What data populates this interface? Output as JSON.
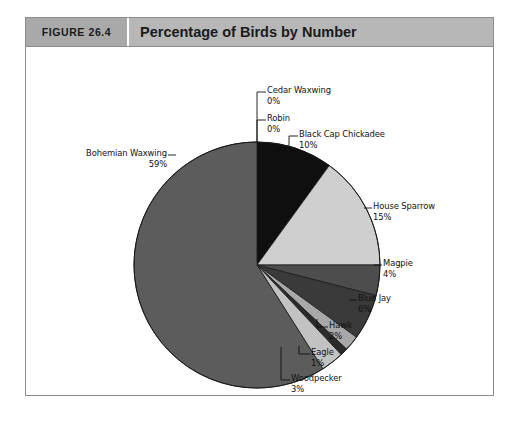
{
  "figure": {
    "number_label": "FIGURE 26.4",
    "title": "Percentage of Birds by Number",
    "header_number_bg": "#a9a9a9",
    "header_title_bg": "#b7b7b7",
    "frame_border": "#8d8d8d",
    "background": "#ffffff"
  },
  "chart_data": {
    "type": "pie",
    "title": "Percentage of Birds by Number",
    "xlabel": "",
    "ylabel": "",
    "units": "percent",
    "start_angle_deg": 0,
    "direction": "clockwise",
    "legend": "none (direct labels with leader lines)",
    "grid": false,
    "categories": [
      "Cedar Waxwing",
      "Robin",
      "Black Cap Chickadee",
      "House Sparrow",
      "Magpie",
      "Blue Jay",
      "Hawk",
      "Eagle",
      "Woodpecker",
      "Bohemian Waxwing"
    ],
    "values": [
      0,
      0,
      10,
      15,
      4,
      6,
      2,
      1,
      3,
      59
    ],
    "slices": [
      {
        "label": "Cedar Waxwing",
        "value": 0,
        "value_text": "0%",
        "color": "#d9d9d9"
      },
      {
        "label": "Robin",
        "value": 0,
        "value_text": "0%",
        "color": "#8f8f8f"
      },
      {
        "label": "Black Cap Chickadee",
        "value": 10,
        "value_text": "10%",
        "color": "#100f0f"
      },
      {
        "label": "House Sparrow",
        "value": 15,
        "value_text": "15%",
        "color": "#cfcfcf"
      },
      {
        "label": "Magpie",
        "value": 4,
        "value_text": "4%",
        "color": "#4d4d4d"
      },
      {
        "label": "Blue Jay",
        "value": 6,
        "value_text": "6%",
        "color": "#3a3a3a"
      },
      {
        "label": "Hawk",
        "value": 2,
        "value_text": "2%",
        "color": "#a8a8a8"
      },
      {
        "label": "Eagle",
        "value": 1,
        "value_text": "1%",
        "color": "#2b2b2b"
      },
      {
        "label": "Woodpecker",
        "value": 3,
        "value_text": "3%",
        "color": "#c2c2c2"
      },
      {
        "label": "Bohemian Waxwing",
        "value": 59,
        "value_text": "59%",
        "color": "#5c5c5c"
      }
    ]
  },
  "labels": {
    "cedar_waxwing": {
      "name": "Cedar Waxwing",
      "value": "0%"
    },
    "robin": {
      "name": "Robin",
      "value": "0%"
    },
    "black_cap_chickadee": {
      "name": "Black Cap Chickadee",
      "value": "10%"
    },
    "house_sparrow": {
      "name": "House Sparrow",
      "value": "15%"
    },
    "magpie": {
      "name": "Magpie",
      "value": "4%"
    },
    "blue_jay": {
      "name": "Blue Jay",
      "value": "6%"
    },
    "hawk": {
      "name": "Hawk",
      "value": "2%"
    },
    "eagle": {
      "name": "Eagle",
      "value": "1%"
    },
    "woodpecker": {
      "name": "Woodpecker",
      "value": "3%"
    },
    "bohemian_waxwing": {
      "name": "Bohemian Waxwing",
      "value": "59%"
    }
  }
}
